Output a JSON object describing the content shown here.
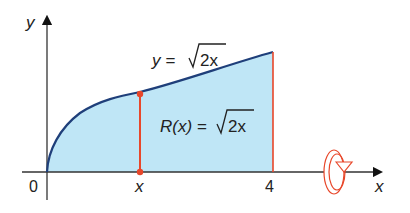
{
  "diagram": {
    "axes": {
      "x_label": "x",
      "y_label": "y",
      "origin_label": "0",
      "x_point_label": "x",
      "x_end_label": "4"
    },
    "curve_label": {
      "lhs": "y =",
      "sqrt_arg": "2x"
    },
    "radius_label": {
      "lhs": "R(x) =",
      "sqrt_arg": "2x"
    },
    "icons": [
      "rotation-about-x-axis-icon"
    ],
    "colors": {
      "fill": "#bfe6f6",
      "curve": "#1f3f7a",
      "radius_line": "#e8472a",
      "axis": "#333333",
      "rotation_icon": "#e8472a"
    }
  }
}
